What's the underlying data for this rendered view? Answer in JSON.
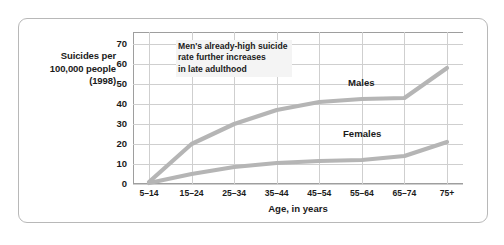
{
  "chart_data": {
    "type": "line",
    "title": "",
    "xlabel": "Age, in years",
    "ylabel": "Suicides per 100,000 people (1998)",
    "ylabel_lines": [
      "Suicides per",
      "100,000 people",
      "(1998)"
    ],
    "categories": [
      "5–14",
      "15–24",
      "25–34",
      "35–44",
      "45–54",
      "55–64",
      "65–74",
      "75+"
    ],
    "yticks": [
      0,
      10,
      20,
      30,
      40,
      50,
      60,
      70
    ],
    "ylim": [
      0,
      76
    ],
    "grid": true,
    "legend_position": "inline-labels",
    "series": [
      {
        "name": "Males",
        "values": [
          1,
          20,
          30,
          37,
          41,
          42.5,
          43,
          58
        ],
        "color": "#b5b5b5"
      },
      {
        "name": "Females",
        "values": [
          0.5,
          5,
          8.5,
          10.5,
          11.5,
          12,
          14,
          21
        ],
        "color": "#b5b5b5"
      }
    ],
    "annotations": [
      {
        "text": "Men's already-high suicide\nrate further increases\nin late adulthood"
      }
    ]
  },
  "colors": {
    "line": "#b5b5b5",
    "grid": "#cfcfcf",
    "axis": "#9e9e9e",
    "frame": "#b8b8b8",
    "text": "#1b1b1b",
    "annotation_bg": "#f4f4f4"
  }
}
